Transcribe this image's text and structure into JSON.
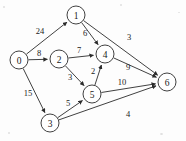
{
  "figure": {
    "background_color": "#fdfdfd",
    "stroke_color": "#2b2b2b",
    "node_fill_color": "#ffffff",
    "width": 186,
    "height": 141
  },
  "chart_data": {
    "type": "diagram",
    "diagram_kind": "directed-weighted-graph",
    "title": "",
    "directed": true,
    "weighted": true,
    "node_radius": 9,
    "nodes": [
      {
        "id": "0",
        "label": "0",
        "x": 19,
        "y": 60
      },
      {
        "id": "1",
        "label": "1",
        "x": 76,
        "y": 15
      },
      {
        "id": "2",
        "label": "2",
        "x": 59,
        "y": 59
      },
      {
        "id": "3",
        "label": "3",
        "x": 50,
        "y": 123
      },
      {
        "id": "4",
        "label": "4",
        "x": 105,
        "y": 54
      },
      {
        "id": "5",
        "label": "5",
        "x": 92,
        "y": 94
      },
      {
        "id": "6",
        "label": "6",
        "x": 167,
        "y": 82
      }
    ],
    "edges": [
      {
        "from": "0",
        "to": "1",
        "weight": "24",
        "lx": 40,
        "ly": 31
      },
      {
        "from": "0",
        "to": "2",
        "weight": "8",
        "lx": 39,
        "ly": 53
      },
      {
        "from": "0",
        "to": "3",
        "weight": "15",
        "lx": 28,
        "ly": 93
      },
      {
        "from": "1",
        "to": "4",
        "weight": "6",
        "lx": 85,
        "ly": 33
      },
      {
        "from": "1",
        "to": "6",
        "weight": "3",
        "lx": 129,
        "ly": 37
      },
      {
        "from": "2",
        "to": "4",
        "weight": "7",
        "lx": 79,
        "ly": 50
      },
      {
        "from": "2",
        "to": "5",
        "weight": "3",
        "lx": 70,
        "ly": 77
      },
      {
        "from": "5",
        "to": "4",
        "weight": "2",
        "lx": 93,
        "ly": 71
      },
      {
        "from": "4",
        "to": "6",
        "weight": "9",
        "lx": 128,
        "ly": 67
      },
      {
        "from": "5",
        "to": "6",
        "weight": "10",
        "lx": 122,
        "ly": 82
      },
      {
        "from": "3",
        "to": "5",
        "weight": "5",
        "lx": 68,
        "ly": 103
      },
      {
        "from": "3",
        "to": "6",
        "weight": "4",
        "lx": 128,
        "ly": 114
      }
    ],
    "weights": [
      "24",
      "8",
      "15",
      "6",
      "3",
      "7",
      "3",
      "2",
      "9",
      "10",
      "5",
      "4"
    ],
    "node_labels": [
      "0",
      "1",
      "2",
      "3",
      "4",
      "5",
      "6"
    ]
  }
}
